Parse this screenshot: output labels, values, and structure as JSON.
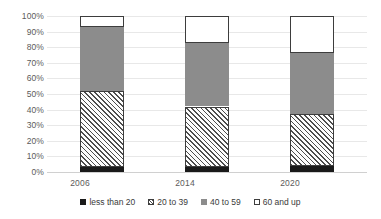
{
  "chart_data": {
    "type": "bar",
    "subtype": "stacked-100-percent",
    "title": "",
    "subtitle": "",
    "xlabel": "",
    "ylabel": "",
    "categories": [
      "2006",
      "2014",
      "2020"
    ],
    "series": [
      {
        "name": "less than 20",
        "values": [
          3,
          3,
          4
        ],
        "color": "#1a1a1a",
        "pattern": "solid-black"
      },
      {
        "name": "20 to 39",
        "values": [
          49,
          39,
          33
        ],
        "color": "#ffffff",
        "pattern": "diagonal-hatch"
      },
      {
        "name": "40 to 59",
        "values": [
          41,
          41,
          39
        ],
        "color": "#8c8c8c",
        "pattern": "solid-gray"
      },
      {
        "name": "60 and up",
        "values": [
          7,
          17,
          24
        ],
        "color": "#ffffff",
        "pattern": "solid-white-outline"
      }
    ],
    "ylim": [
      0,
      100
    ],
    "ytick_labels": [
      "0%",
      "10%",
      "20%",
      "30%",
      "40%",
      "50%",
      "60%",
      "70%",
      "80%",
      "90%",
      "100%"
    ],
    "ytick_values": [
      0,
      10,
      20,
      30,
      40,
      50,
      60,
      70,
      80,
      90,
      100
    ],
    "grid": true,
    "grid_axis": "y",
    "legend_position": "bottom",
    "annotations": []
  },
  "axes": {
    "y": {
      "ticks": [
        {
          "label": "100%",
          "value": 100
        },
        {
          "label": "90%",
          "value": 90
        },
        {
          "label": "80%",
          "value": 80
        },
        {
          "label": "70%",
          "value": 70
        },
        {
          "label": "60%",
          "value": 60
        },
        {
          "label": "50%",
          "value": 50
        },
        {
          "label": "40%",
          "value": 40
        },
        {
          "label": "30%",
          "value": 30
        },
        {
          "label": "20%",
          "value": 20
        },
        {
          "label": "10%",
          "value": 10
        },
        {
          "label": "0%",
          "value": 0
        }
      ]
    },
    "x": {
      "ticks": [
        {
          "label": "2006"
        },
        {
          "label": "2014"
        },
        {
          "label": "2020"
        }
      ]
    }
  },
  "legend": {
    "items": [
      {
        "label": "less than 20",
        "swatch": "solid-black-swatch"
      },
      {
        "label": "20 to 39",
        "swatch": "hatched-swatch"
      },
      {
        "label": "40 to 59",
        "swatch": "solid-gray-swatch"
      },
      {
        "label": "60 and up",
        "swatch": "outlined-white-swatch"
      }
    ]
  },
  "colors": {
    "less_than_20": "#1a1a1a",
    "twenty_to_39": "#ffffff",
    "forty_to_59": "#8c8c8c",
    "sixty_and_up": "#ffffff",
    "gridline": "#e8e8e8",
    "text": "#5b5b5b"
  }
}
